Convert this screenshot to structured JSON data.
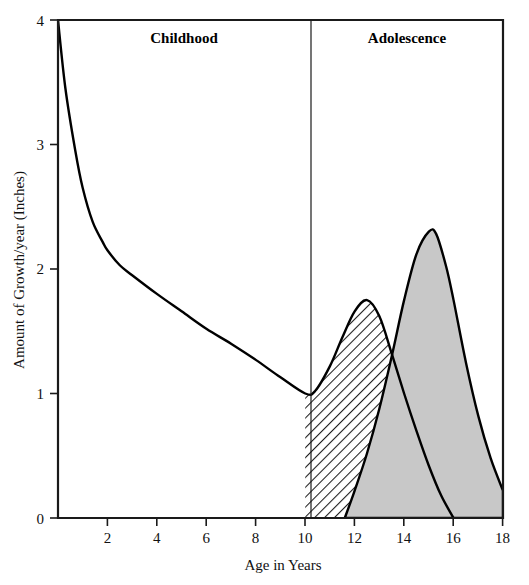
{
  "figure": {
    "background_color": "#ffffff",
    "frame_color": "#1a1a1a",
    "phase_divider_age": 10
  },
  "labels": {
    "childhood": "Childhood",
    "adolescence": "Adolescence",
    "x_axis_title": "Age in Years",
    "y_axis_title": "Amount of Growth/year (Inches)"
  },
  "axes": {
    "x_ticks": [
      "2",
      "4",
      "6",
      "8",
      "10",
      "12",
      "14",
      "16",
      "18"
    ],
    "y_ticks": [
      "0",
      "1",
      "2",
      "3",
      "4"
    ],
    "x_origin_label": "0"
  },
  "chart_data": {
    "type": "area",
    "title": "",
    "subtitle": "",
    "xlabel": "Age in Years",
    "ylabel": "Amount of Growth/year (Inches)",
    "xlim": [
      0,
      18
    ],
    "ylim": [
      0,
      4
    ],
    "x_ticks": [
      0,
      2,
      4,
      6,
      8,
      10,
      12,
      14,
      16,
      18
    ],
    "y_ticks": [
      0,
      1,
      2,
      3,
      4
    ],
    "grid": false,
    "legend": "none",
    "annotations": [
      {
        "text": "Childhood",
        "x_range": [
          0,
          10
        ],
        "position": "top"
      },
      {
        "text": "Adolescence",
        "x_range": [
          10,
          18
        ],
        "position": "top"
      }
    ],
    "vertical_divider": {
      "x": 10,
      "label_split": true
    },
    "series": [
      {
        "name": "Childhood growth curve",
        "style": "line",
        "fill": "none",
        "x": [
          0,
          0.3,
          0.7,
          1.0,
          1.4,
          1.8,
          2.0,
          2.5,
          3.0,
          4.0,
          5.0,
          6.0,
          7.0,
          8.0,
          9.0,
          10.0
        ],
        "values": [
          4.0,
          3.45,
          2.95,
          2.65,
          2.38,
          2.22,
          2.15,
          2.03,
          1.95,
          1.8,
          1.66,
          1.52,
          1.4,
          1.27,
          1.13,
          1.0
        ]
      },
      {
        "name": "Early maturer adolescent growth spurt",
        "style": "area",
        "fill": "hatched",
        "peak_age": 12.5,
        "peak_value": 1.75,
        "baseline_end_age": 16.0,
        "x": [
          10.0,
          10.4,
          11.0,
          11.5,
          12.0,
          12.5,
          13.0,
          13.5,
          14.0,
          14.5,
          15.0,
          15.5,
          16.0
        ],
        "values": [
          1.0,
          1.02,
          1.22,
          1.45,
          1.66,
          1.75,
          1.62,
          1.32,
          1.0,
          0.7,
          0.42,
          0.18,
          0.0
        ]
      },
      {
        "name": "Late maturer adolescent growth spurt",
        "style": "area",
        "fill": "solid-gray",
        "fill_color": "#c8c8c8",
        "peak_age": 15.0,
        "peak_value": 2.3,
        "baseline_start_age": 11.6,
        "x": [
          11.6,
          12.0,
          12.5,
          13.0,
          13.5,
          14.0,
          14.5,
          15.0,
          15.3,
          15.7,
          16.0,
          16.5,
          17.0,
          17.5,
          18.0
        ],
        "values": [
          0.0,
          0.22,
          0.52,
          0.88,
          1.3,
          1.75,
          2.12,
          2.3,
          2.28,
          2.02,
          1.75,
          1.25,
          0.82,
          0.48,
          0.22
        ]
      }
    ]
  }
}
